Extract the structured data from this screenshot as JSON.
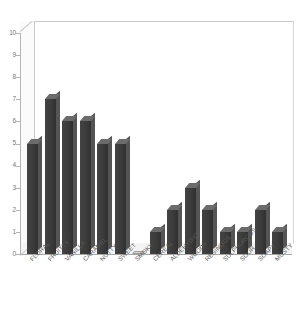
{
  "chart_data": {
    "type": "bar",
    "title": "",
    "subtitle": "",
    "xlabel": "",
    "ylabel": "",
    "ylim": [
      0,
      10
    ],
    "yticks": [
      0,
      1,
      2,
      3,
      4,
      5,
      6,
      7,
      8,
      9,
      10
    ],
    "grid": false,
    "legend": null,
    "style_3d": true,
    "categories": [
      "FLORAL",
      "FRUITTY",
      "VANILLA",
      "CARAMEL",
      "NUTTY",
      "SWEET",
      "SMOKY",
      "CEREAL",
      "ALDEHYDIC",
      "WOODY",
      "RESINOUS",
      "SULPHUROUS",
      "SOUR",
      "SOAPY",
      "MUSTY"
    ],
    "values": [
      5,
      7,
      6,
      6,
      5,
      5,
      0,
      1,
      2,
      3,
      2,
      1,
      1,
      2,
      1
    ],
    "colors": {
      "bar_front": "#3b3b3b",
      "bar_side": "#555555",
      "bar_top": "#6b6b6b",
      "background": "#ffffff",
      "floor": "#f4f4f4",
      "axis": "#b4b4b4",
      "tick_label": "#777777",
      "category_label": "#5a5a5a"
    }
  }
}
